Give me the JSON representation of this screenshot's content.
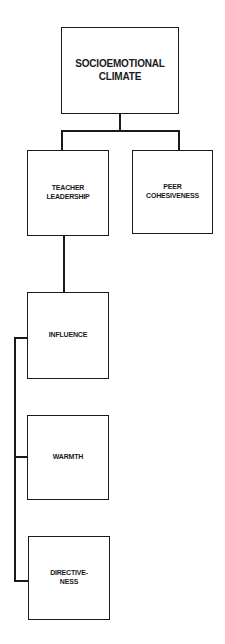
{
  "diagram": {
    "root": {
      "label_line1": "SOCIOEMOTIONAL",
      "label_line2": "CLIMATE"
    },
    "level2": [
      {
        "label_line1": "TEACHER",
        "label_line2": "LEADERSHIP"
      },
      {
        "label_line1": "PEER",
        "label_line2": "COHESIVENESS"
      }
    ],
    "level3": [
      {
        "label_line1": "INFLUENCE",
        "label_line2": ""
      },
      {
        "label_line1": "WARMTH",
        "label_line2": ""
      },
      {
        "label_line1": "DIRECTIVE-",
        "label_line2": "NESS"
      }
    ],
    "colors": {
      "stroke": "#1a1a1a",
      "background": "#ffffff"
    }
  }
}
